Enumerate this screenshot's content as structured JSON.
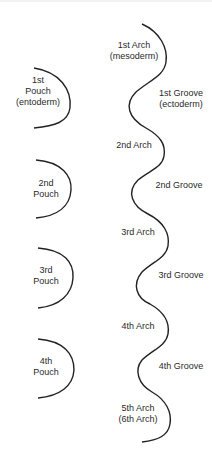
{
  "diagram": {
    "pouches": [
      {
        "label": "1st\nPouch\n(entoderm)"
      },
      {
        "label": "2nd\nPouch"
      },
      {
        "label": "3rd\nPouch"
      },
      {
        "label": "4th\nPouch"
      }
    ],
    "arches": [
      {
        "label": "1st Arch\n(mesoderm)"
      },
      {
        "label": "2nd Arch"
      },
      {
        "label": "3rd Arch"
      },
      {
        "label": "4th Arch"
      },
      {
        "label": "5th Arch\n(6th Arch)"
      }
    ],
    "grooves": [
      {
        "label": "1st Groove\n(ectoderm)"
      },
      {
        "label": "2nd Groove"
      },
      {
        "label": "3rd Groove"
      },
      {
        "label": "4th Groove"
      }
    ],
    "line_color": "#222222"
  }
}
